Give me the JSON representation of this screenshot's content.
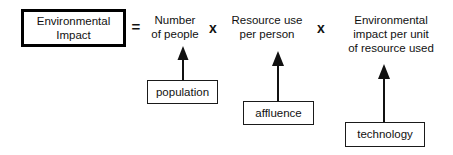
{
  "diagram": {
    "result": {
      "line1": "Environmental",
      "line2": "Impact"
    },
    "operators": {
      "equals": "=",
      "times_1": "x",
      "times_2": "x"
    },
    "factors": [
      {
        "id": "number-of-people",
        "line1": "Number",
        "line2": "of people",
        "line3": ""
      },
      {
        "id": "resource-use-per-person",
        "line1": "Resource use",
        "line2": "per person",
        "line3": ""
      },
      {
        "id": "environmental-impact-per-unit",
        "line1": "Environmental",
        "line2": "impact per unit",
        "line3": "of resource used"
      }
    ],
    "labels": [
      {
        "id": "population",
        "text": "population"
      },
      {
        "id": "affluence",
        "text": "affluence"
      },
      {
        "id": "technology",
        "text": "technology"
      }
    ],
    "colors": {
      "ink": "#111111",
      "background": "#ffffff",
      "result_border": "#000000",
      "label_border": "#1a1a1a"
    }
  }
}
